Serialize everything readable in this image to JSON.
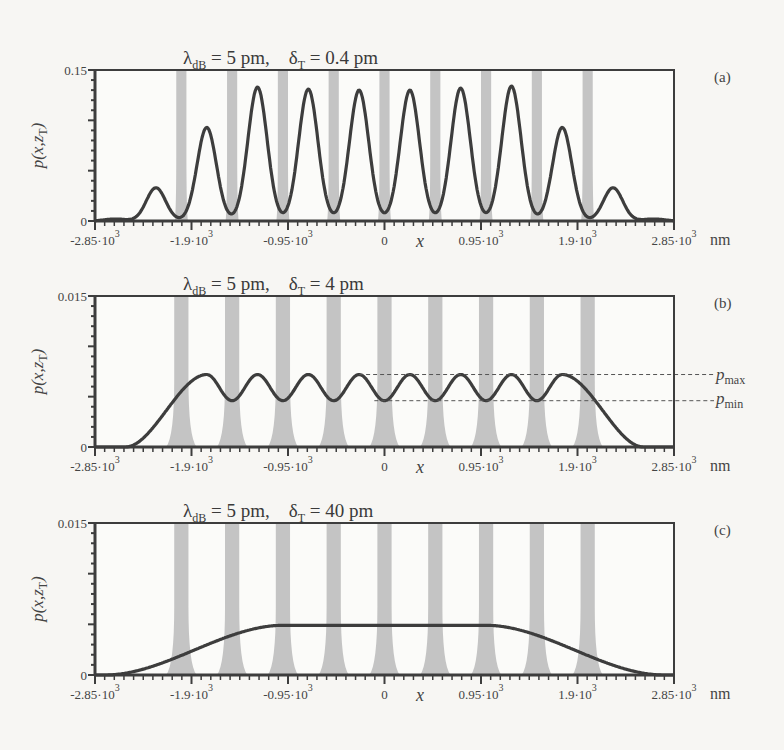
{
  "figure": {
    "colors": {
      "background": "#f7f6f3",
      "curve": "#3d3d3d",
      "slit": "#c4c4c4",
      "frame": "#3d3d3d",
      "dashed": "#555555"
    },
    "x_axis": {
      "label": "x",
      "unit": "nm",
      "ticks": [
        {
          "mant": "-2.85·10",
          "exp": "3",
          "value": -2850
        },
        {
          "mant": "-1.9·10",
          "exp": "3",
          "value": -1900
        },
        {
          "mant": "-0.95·10",
          "exp": "3",
          "value": -950
        },
        {
          "mant": "0",
          "exp": "",
          "value": 0
        },
        {
          "mant": "0.95·10",
          "exp": "3",
          "value": 950
        },
        {
          "mant": "1.9·10",
          "exp": "3",
          "value": 1900
        },
        {
          "mant": "2.85·10",
          "exp": "3",
          "value": 2850
        }
      ]
    },
    "y_label": "p(x,z",
    "y_label_sub": "T",
    "y_label_close": ")",
    "pmax_label": "p",
    "pmax_sub": "max",
    "pmin_label": "p",
    "pmin_sub": "min"
  },
  "chart_data": [
    {
      "type": "line",
      "panel": "(a)",
      "title": "λdB = 5 pm,   δT = 0.4 pm",
      "title_parts": {
        "lambda": "λ",
        "lambda_sub": "dB",
        "lambda_val": " = 5 pm,",
        "delta": "δ",
        "delta_sub": "T",
        "delta_val": " = 0.4 pm"
      },
      "xlabel": "x",
      "ylabel": "p(x,zT)",
      "xunit": "nm",
      "xlim": [
        -2850,
        2850
      ],
      "ylim": [
        0,
        0.15
      ],
      "ytick_labels": [
        "0",
        "0.15"
      ],
      "slits_x": [
        -2000,
        -1500,
        -1000,
        -500,
        0,
        500,
        1000,
        1500,
        2000
      ],
      "slit_width_top": 100,
      "slit_width_bottom": 130,
      "peaks": [
        {
          "x": -2250,
          "y": 0.033
        },
        {
          "x": -1750,
          "y": 0.093
        },
        {
          "x": -1250,
          "y": 0.133
        },
        {
          "x": -750,
          "y": 0.131
        },
        {
          "x": -250,
          "y": 0.13
        },
        {
          "x": 250,
          "y": 0.13
        },
        {
          "x": 750,
          "y": 0.132
        },
        {
          "x": 1250,
          "y": 0.134
        },
        {
          "x": 1750,
          "y": 0.093
        },
        {
          "x": 2250,
          "y": 0.033
        }
      ],
      "peak_sigma": 95
    },
    {
      "type": "line",
      "panel": "(b)",
      "title": "λdB = 5 pm,   δT = 4 pm",
      "title_parts": {
        "lambda": "λ",
        "lambda_sub": "dB",
        "lambda_val": " = 5 pm,",
        "delta": "δ",
        "delta_sub": "T",
        "delta_val": " = 4 pm"
      },
      "xlabel": "x",
      "ylabel": "p(x,zT)",
      "xunit": "nm",
      "xlim": [
        -2850,
        2850
      ],
      "ylim": [
        0,
        0.015
      ],
      "ytick_labels": [
        "0",
        "0.015"
      ],
      "slits_x": [
        -2000,
        -1500,
        -1000,
        -500,
        0,
        500,
        1000,
        1500,
        2000
      ],
      "slit_width_top": 140,
      "slit_width_bottom": 300,
      "p_max": 0.0072,
      "p_min": 0.0046,
      "peaks_x": [
        -1750,
        -1250,
        -750,
        -250,
        250,
        750,
        1250,
        1750
      ],
      "edge_falloff": {
        "start": 2000,
        "end": 2500
      }
    },
    {
      "type": "line",
      "panel": "(c)",
      "title": "λdB = 5 pm,   δT = 40 pm",
      "title_parts": {
        "lambda": "λ",
        "lambda_sub": "dB",
        "lambda_val": " = 5 pm,",
        "delta": "δ",
        "delta_sub": "T",
        "delta_val": " = 40 pm"
      },
      "xlabel": "x",
      "ylabel": "p(x,zT)",
      "xunit": "nm",
      "xlim": [
        -2850,
        2850
      ],
      "ylim": [
        0,
        0.015
      ],
      "ytick_labels": [
        "0",
        "0.015"
      ],
      "slits_x": [
        -2000,
        -1500,
        -1000,
        -500,
        0,
        500,
        1000,
        1500,
        2000
      ],
      "slit_width_top": 140,
      "slit_width_bottom": 300,
      "plateau": 0.0049,
      "plateau_range": [
        -1000,
        1000
      ],
      "edge_range": [
        -2850,
        2850
      ]
    }
  ]
}
